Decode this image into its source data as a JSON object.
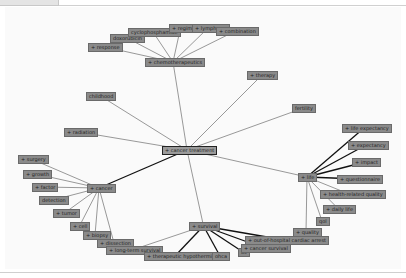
{
  "center": {
    "id": "center",
    "label": "+ cancer treatment",
    "x": 162,
    "y": 146,
    "w": 46
  },
  "nodes": [
    {
      "id": "chemo",
      "label": "+ chemotherapeutics",
      "x": 145,
      "y": 58,
      "w": 52
    },
    {
      "id": "response",
      "label": "+ response",
      "x": 88,
      "y": 43,
      "w": 30
    },
    {
      "id": "doxorubicin",
      "label": "doxorubicin",
      "x": 110,
      "y": 34,
      "w": 30
    },
    {
      "id": "cyclophosphamide",
      "label": "cyclophosphamide",
      "x": 128,
      "y": 28,
      "w": 46
    },
    {
      "id": "regime",
      "label": "+ regime",
      "x": 169,
      "y": 24,
      "w": 19
    },
    {
      "id": "lymphoma",
      "label": "+ lymphoma",
      "x": 192,
      "y": 24,
      "w": 28
    },
    {
      "id": "combination",
      "label": "+ combination",
      "x": 216,
      "y": 27,
      "w": 35
    },
    {
      "id": "therapy",
      "label": "+ therapy",
      "x": 247,
      "y": 71,
      "w": 26
    },
    {
      "id": "childhood",
      "label": "childhood",
      "x": 86,
      "y": 92,
      "w": 25
    },
    {
      "id": "fertility",
      "label": "fertility",
      "x": 292,
      "y": 104,
      "w": 19
    },
    {
      "id": "radiation",
      "label": "+ radiation",
      "x": 64,
      "y": 128,
      "w": 27
    },
    {
      "id": "cancer",
      "label": "+ cancer",
      "x": 87,
      "y": 184,
      "w": 20
    },
    {
      "id": "surgery",
      "label": "+ surgery",
      "x": 18,
      "y": 155,
      "w": 23
    },
    {
      "id": "growth",
      "label": "+ growth",
      "x": 23,
      "y": 170,
      "w": 22
    },
    {
      "id": "factor",
      "label": "+ factor",
      "x": 32,
      "y": 183,
      "w": 20
    },
    {
      "id": "detection",
      "label": "detection",
      "x": 39,
      "y": 196,
      "w": 24
    },
    {
      "id": "tumor",
      "label": "+ tumor",
      "x": 53,
      "y": 209,
      "w": 19
    },
    {
      "id": "cell",
      "label": "+ cell",
      "x": 70,
      "y": 222,
      "w": 15
    },
    {
      "id": "biopsy",
      "label": "+ biopsy",
      "x": 83,
      "y": 231,
      "w": 20
    },
    {
      "id": "dissection",
      "label": "+ dissection",
      "x": 97,
      "y": 239,
      "w": 30
    },
    {
      "id": "life",
      "label": "+ life",
      "x": 298,
      "y": 173,
      "w": 14
    },
    {
      "id": "life_expectancy",
      "label": "+ life expectancy",
      "x": 342,
      "y": 124,
      "w": 40
    },
    {
      "id": "expectancy",
      "label": "+ expectancy",
      "x": 348,
      "y": 141,
      "w": 32
    },
    {
      "id": "impact",
      "label": "+ impact",
      "x": 352,
      "y": 158,
      "w": 22
    },
    {
      "id": "questionnaire",
      "label": "+ questionnaire",
      "x": 337,
      "y": 175,
      "w": 38
    },
    {
      "id": "hrqol",
      "label": "+ health-related quality",
      "x": 320,
      "y": 190,
      "w": 54
    },
    {
      "id": "daily_life",
      "label": "+ daily life",
      "x": 323,
      "y": 205,
      "w": 27
    },
    {
      "id": "qol",
      "label": "qol",
      "x": 316,
      "y": 217,
      "w": 8
    },
    {
      "id": "quality",
      "label": "+ quality",
      "x": 293,
      "y": 228,
      "w": 22
    },
    {
      "id": "survival",
      "label": "+ survival",
      "x": 189,
      "y": 222,
      "w": 25
    },
    {
      "id": "long_term",
      "label": "+ long-term survival",
      "x": 106,
      "y": 246,
      "w": 48
    },
    {
      "id": "hypothermia",
      "label": "+ therapeutic hypothermia",
      "x": 144,
      "y": 252,
      "w": 58
    },
    {
      "id": "ohca",
      "label": "ohca",
      "x": 212,
      "y": 252,
      "w": 12
    },
    {
      "id": "os",
      "label": "os",
      "x": 238,
      "y": 248,
      "w": 6
    },
    {
      "id": "cancer_survival",
      "label": "+ cancer survival",
      "x": 241,
      "y": 244,
      "w": 42
    },
    {
      "id": "ohca_full",
      "label": "+ out-of-hospital cardiac arrest",
      "x": 245,
      "y": 236,
      "w": 75
    }
  ],
  "edges": [
    [
      "center",
      "chemo",
      1
    ],
    [
      "center",
      "therapy",
      1
    ],
    [
      "center",
      "childhood",
      1
    ],
    [
      "center",
      "fertility",
      1
    ],
    [
      "center",
      "radiation",
      1
    ],
    [
      "center",
      "cancer",
      2
    ],
    [
      "center",
      "life",
      1
    ],
    [
      "center",
      "survival",
      1
    ],
    [
      "chemo",
      "response",
      1
    ],
    [
      "chemo",
      "doxorubicin",
      1
    ],
    [
      "chemo",
      "cyclophosphamide",
      1
    ],
    [
      "chemo",
      "regime",
      1
    ],
    [
      "chemo",
      "lymphoma",
      1
    ],
    [
      "chemo",
      "combination",
      1
    ],
    [
      "cancer",
      "surgery",
      1
    ],
    [
      "cancer",
      "growth",
      1
    ],
    [
      "cancer",
      "factor",
      1
    ],
    [
      "cancer",
      "detection",
      1
    ],
    [
      "cancer",
      "tumor",
      1
    ],
    [
      "cancer",
      "cell",
      1
    ],
    [
      "cancer",
      "biopsy",
      1
    ],
    [
      "cancer",
      "dissection",
      1
    ],
    [
      "life",
      "life_expectancy",
      2
    ],
    [
      "life",
      "expectancy",
      2
    ],
    [
      "life",
      "impact",
      2
    ],
    [
      "life",
      "questionnaire",
      2
    ],
    [
      "life",
      "hrqol",
      1
    ],
    [
      "life",
      "daily_life",
      1
    ],
    [
      "life",
      "qol",
      1
    ],
    [
      "life",
      "quality",
      1
    ],
    [
      "survival",
      "long_term",
      1
    ],
    [
      "survival",
      "hypothermia",
      2
    ],
    [
      "survival",
      "ohca",
      2
    ],
    [
      "survival",
      "os",
      2
    ],
    [
      "survival",
      "cancer_survival",
      2
    ],
    [
      "survival",
      "ohca_full",
      2
    ]
  ],
  "colors": {
    "node_fill": "#8a8a8a",
    "node_border": "#6a6a6a",
    "edge": "#555555",
    "edge_strong": "#111111",
    "background": "#fafafa"
  }
}
